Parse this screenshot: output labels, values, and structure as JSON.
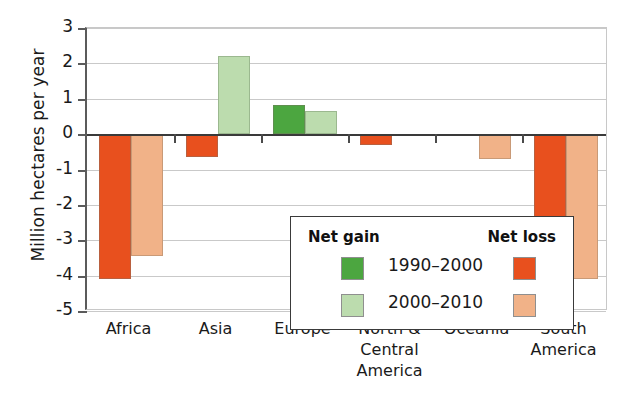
{
  "chart_data": {
    "type": "bar",
    "title": "",
    "xlabel": "",
    "ylabel": "Million hectares per year",
    "ylim": [
      -5,
      3
    ],
    "yticks": [
      3,
      2,
      1,
      0,
      -1,
      -2,
      -3,
      -4,
      -5
    ],
    "ytick_labels": [
      "3",
      "2",
      "1",
      "0",
      "-1",
      "-2",
      "-3",
      "-4",
      "-5"
    ],
    "grid": true,
    "legend_position": "inside-center-bottom",
    "categories": [
      "Africa",
      "Asia",
      "Europe",
      "North & Central America",
      "Oceania",
      "South America"
    ],
    "category_lines": [
      [
        "Africa"
      ],
      [
        "Asia"
      ],
      [
        "Europe"
      ],
      [
        "North &",
        "Central",
        "America"
      ],
      [
        "Oceania"
      ],
      [
        "South",
        "America"
      ]
    ],
    "series": [
      {
        "name": "1990–2000",
        "values": [
          -4.1,
          -0.65,
          0.82,
          -0.3,
          0.0,
          -4.35
        ]
      },
      {
        "name": "2000–2010",
        "values": [
          -3.45,
          2.22,
          0.65,
          0.0,
          -0.7,
          -4.1
        ]
      }
    ],
    "colors": {
      "net_gain_1990_2000": "#4CA640",
      "net_gain_2000_2010": "#bcdcae",
      "net_loss_1990_2000": "#E8501E",
      "net_loss_2000_2010": "#F1B288",
      "axis": "#3a3a3a",
      "gridline": "#c9c9c9"
    }
  },
  "legend": {
    "gain_header": "Net gain",
    "loss_header": "Net loss",
    "rows": [
      {
        "label": "1990–2000",
        "gain_color": "#4CA640",
        "loss_color": "#E8501E"
      },
      {
        "label": "2000–2010",
        "gain_color": "#bcdcae",
        "loss_color": "#F1B288"
      }
    ]
  }
}
